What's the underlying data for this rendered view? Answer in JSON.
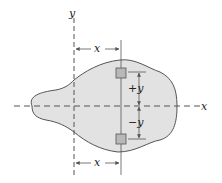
{
  "diagram": {
    "labels": {
      "y_axis": "y",
      "x_axis": "x",
      "top_x_dim": "x",
      "bottom_x_dim": "x",
      "plus_y": "+y",
      "minus_y": "−y"
    },
    "colors": {
      "shape_fill": "#e2e2e2",
      "shape_stroke": "#555555",
      "element_fill": "#b8b8b8",
      "axis": "#555555"
    }
  }
}
